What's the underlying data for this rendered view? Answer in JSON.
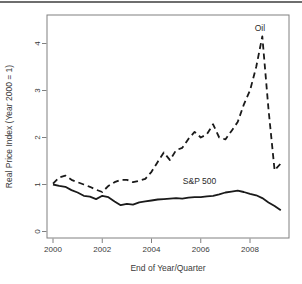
{
  "figure": {
    "top_rule_present": true
  },
  "colors": {
    "line": "#1a1a1a",
    "axis": "#808080",
    "text": "#3a3a3a",
    "rule": "#6e6e6e",
    "background": "#ffffff"
  },
  "chart_data": {
    "type": "line",
    "title": "",
    "xlabel": "End of Year/Quarter",
    "ylabel": "Real Price Index (Year 2000 = 1)",
    "xticks": [
      2000,
      2002,
      2004,
      2006,
      2008
    ],
    "yticks": [
      0,
      1,
      2,
      3,
      4
    ],
    "xlim": [
      1999.75,
      2009.8
    ],
    "ylim": [
      -0.15,
      4.6
    ],
    "grid": false,
    "legend": "inline-text-annotations",
    "x": [
      2000.0,
      2000.25,
      2000.5,
      2000.75,
      2001.0,
      2001.25,
      2001.5,
      2001.75,
      2002.0,
      2002.25,
      2002.5,
      2002.75,
      2003.0,
      2003.25,
      2003.5,
      2003.75,
      2004.0,
      2004.25,
      2004.5,
      2004.75,
      2005.0,
      2005.25,
      2005.5,
      2005.75,
      2006.0,
      2006.25,
      2006.5,
      2006.75,
      2007.0,
      2007.25,
      2007.5,
      2007.75,
      2008.0,
      2008.25,
      2008.5,
      2008.75,
      2009.0,
      2009.25
    ],
    "series": [
      {
        "name": "Oil",
        "style": "dashed",
        "color": "#1a1a1a",
        "values": [
          1.02,
          1.15,
          1.19,
          1.1,
          1.05,
          1.0,
          0.95,
          0.89,
          0.84,
          0.97,
          1.05,
          1.1,
          1.1,
          1.05,
          1.08,
          1.12,
          1.27,
          1.48,
          1.68,
          1.52,
          1.73,
          1.78,
          1.97,
          2.12,
          2.0,
          2.07,
          2.28,
          2.0,
          1.96,
          2.14,
          2.33,
          2.7,
          3.0,
          3.5,
          4.15,
          2.6,
          1.3,
          1.45
        ]
      },
      {
        "name": "S&P 500",
        "style": "solid",
        "color": "#1a1a1a",
        "values": [
          1.0,
          0.97,
          0.95,
          0.88,
          0.83,
          0.76,
          0.74,
          0.69,
          0.76,
          0.73,
          0.64,
          0.56,
          0.59,
          0.57,
          0.62,
          0.64,
          0.66,
          0.68,
          0.69,
          0.7,
          0.71,
          0.7,
          0.72,
          0.73,
          0.73,
          0.75,
          0.76,
          0.79,
          0.83,
          0.85,
          0.87,
          0.84,
          0.8,
          0.77,
          0.71,
          0.62,
          0.54,
          0.45
        ]
      }
    ],
    "annotations": [
      {
        "text": "Oil",
        "x": 2008.4,
        "y": 4.27
      },
      {
        "text": "S&P 500",
        "x": 2005.95,
        "y": 1.02
      }
    ]
  }
}
